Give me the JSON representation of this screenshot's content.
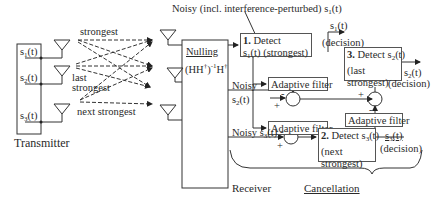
{
  "transmitter": {
    "label": "Transmitter",
    "inputs": [
      "s1(t)",
      "s2(t)",
      "s3(t)"
    ]
  },
  "channel_labels": {
    "strongest": "strongest",
    "last_strongest_1": "last",
    "last_strongest_2": "strongest",
    "next_strongest": "next strongest"
  },
  "nulling": {
    "title": "Nulling",
    "formula": "(HH†)⁻¹H†"
  },
  "top_annotation": "Noisy (incl. interference-perturbed) s1(t)",
  "detect1": {
    "num": "1.",
    "line1": "Detect",
    "line2": "s1(t) (strongest)",
    "output": "s1(t)",
    "output_note": "(decision)"
  },
  "detect2": {
    "num": "2.",
    "line1": "Detect s3(t)",
    "line2": "(next",
    "line3": "strongest)",
    "output": "s3(t)",
    "output_note": "(decision)"
  },
  "detect3": {
    "num": "3.",
    "line1": "Detect s2(t)",
    "line2": "(last",
    "line3": "strongest)",
    "output": "s2(t)",
    "output_note": "(decision)"
  },
  "noisy_s2": {
    "line1": "Noisy",
    "line2": "s2(t)"
  },
  "noisy_s3": "Noisy s3(t)",
  "adaptive_filter": "Adaptive filter",
  "signs": {
    "plus": "+",
    "minus": "-"
  },
  "receiver": "Receiver",
  "cancellation": "Cancellation"
}
